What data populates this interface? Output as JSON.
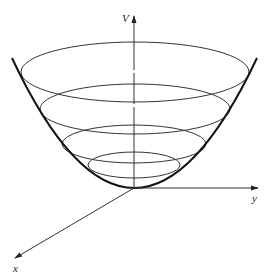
{
  "diagram": {
    "type": "3d paraboloid (bowl) with horizontal level-set ellipses",
    "axes": {
      "vertical": {
        "label": "V"
      },
      "horizontal": {
        "label": "y"
      },
      "depth": {
        "label": "x"
      }
    },
    "level_curves": 4,
    "colors": {
      "stroke": "#222222",
      "background": "#ffffff"
    }
  }
}
